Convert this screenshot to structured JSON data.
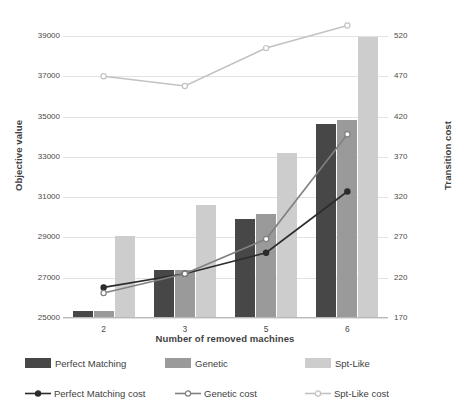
{
  "chart_data": {
    "type": "bar",
    "title": "",
    "xlabel": "Number of removed machines",
    "ylabel": "Objective value",
    "y2label": "Transition cost",
    "categories": [
      "2",
      "3",
      "5",
      "6"
    ],
    "ylim": [
      25000,
      39000
    ],
    "yticks": [
      25000,
      27000,
      29000,
      31000,
      33000,
      35000,
      37000,
      39000
    ],
    "y2lim": [
      170,
      520
    ],
    "y2ticks": [
      170,
      220,
      270,
      320,
      370,
      420,
      470,
      520
    ],
    "grid": true,
    "legend_position": "bottom",
    "bar_series": [
      {
        "name": "Perfect Matching",
        "color": "#474747",
        "axis": "left",
        "values": [
          25340,
          27390,
          29920,
          34640
        ]
      },
      {
        "name": "Genetic",
        "color": "#9a9a9a",
        "axis": "left",
        "values": [
          25340,
          27390,
          30170,
          34840
        ]
      },
      {
        "name": "Spt-Like",
        "color": "#cdcdcd",
        "axis": "left",
        "values": [
          29080,
          30620,
          33190,
          38960
        ]
      }
    ],
    "line_series": [
      {
        "name": "Perfect Matching cost",
        "color": "#2b2b2b",
        "axis": "right",
        "marker": "filled-circle",
        "dash": "solid",
        "values": [
          208,
          225,
          251,
          327
        ]
      },
      {
        "name": "Genetic cost",
        "color": "#808080",
        "axis": "right",
        "marker": "open-circle",
        "dash": "solid",
        "values": [
          201,
          225,
          268,
          398
        ]
      },
      {
        "name": "Spt-Like cost",
        "color": "#c2c2c2",
        "axis": "right",
        "marker": "open-circle",
        "dash": "solid",
        "values": [
          470,
          458,
          505,
          533
        ]
      }
    ]
  }
}
